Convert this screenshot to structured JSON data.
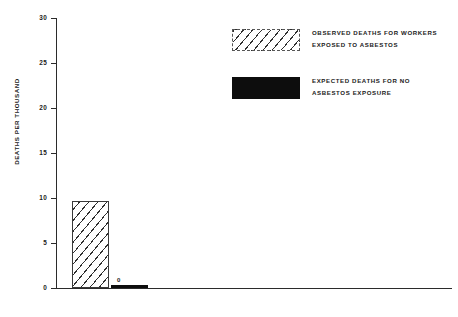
{
  "chart_data": {
    "type": "bar",
    "title": "",
    "subtitle": "",
    "xlabel": "",
    "ylabel": "DEATHS PER THOUSAND",
    "ylim": [
      0,
      30
    ],
    "ytick_labels": [
      "0",
      "5",
      "10",
      "15",
      "20",
      "25",
      "30"
    ],
    "ytick_values": [
      0,
      5,
      10,
      15,
      20,
      25,
      30
    ],
    "grid": false,
    "legend_position": "top-right",
    "categories": [
      "ASBESTOSIS",
      "LUNG CANCER",
      "MESOTHELIOMA",
      "OTHER CANCERS"
    ],
    "series": [
      {
        "name": "OBSERVED DEATHS FOR WORKERS EXPOSED TO ASBESTOS",
        "style": "hatched",
        "values": [
          9.7,
          28.3,
          10.0,
          18.2
        ]
      },
      {
        "name": "EXPECTED DEATHS FOR NO ASBESTOS EXPOSURE",
        "style": "solid-black",
        "values": [
          0.3,
          6.3,
          0.3,
          12.0
        ]
      }
    ],
    "annotations": [
      {
        "category": "ASBESTOSIS",
        "series": "expected",
        "label": "0"
      },
      {
        "category": "MESOTHELIOMA",
        "series": "expected",
        "label": "0"
      }
    ]
  },
  "axis": {
    "y_title": "DEATHS PER THOUSAND",
    "ticks": [
      {
        "label": "30",
        "value": 30
      },
      {
        "label": "25",
        "value": 25
      },
      {
        "label": "20",
        "value": 20
      },
      {
        "label": "15",
        "value": 15
      },
      {
        "label": "10",
        "value": 10
      },
      {
        "label": "5",
        "value": 5
      },
      {
        "label": "0",
        "value": 0
      }
    ]
  },
  "categories": [
    {
      "label": "ASBESTOSIS"
    },
    {
      "label": "LUNG CANCER"
    },
    {
      "label": "MESOTHELIOMA"
    },
    {
      "label": "OTHER CANCERS"
    }
  ],
  "legend": {
    "items": [
      {
        "swatch": "hatched",
        "line1": "OBSERVED DEATHS FOR WORKERS",
        "line2": "EXPOSED TO ASBESTOS"
      },
      {
        "swatch": "solid-black",
        "line1": "EXPECTED DEATHS FOR NO",
        "line2": "ASBESTOS EXPOSURE"
      }
    ]
  },
  "bar_notes": {
    "asbestosis_expected": "0",
    "mesothelioma_expected": "0"
  },
  "colors": {
    "axis": "#2b2b2b",
    "text": "#1a1a1a",
    "observed_fill": "#ffffff",
    "observed_hatch": "#2f2f2f",
    "expected_fill": "#0d0d0d",
    "background": "#ffffff"
  }
}
